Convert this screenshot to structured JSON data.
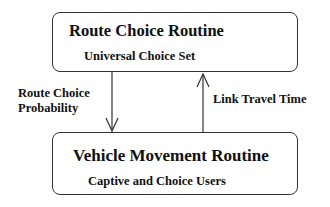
{
  "diagram": {
    "nodes": [
      {
        "id": "route-choice",
        "title": "Route Choice Routine",
        "subtitle": "Universal Choice Set"
      },
      {
        "id": "vehicle-movement",
        "title": "Vehicle Movement Routine",
        "subtitle": "Captive and Choice Users"
      }
    ],
    "edges": [
      {
        "from": "route-choice",
        "to": "vehicle-movement",
        "label_line1": "Route Choice",
        "label_line2": "Probability"
      },
      {
        "from": "vehicle-movement",
        "to": "route-choice",
        "label": "Link Travel Time"
      }
    ]
  }
}
